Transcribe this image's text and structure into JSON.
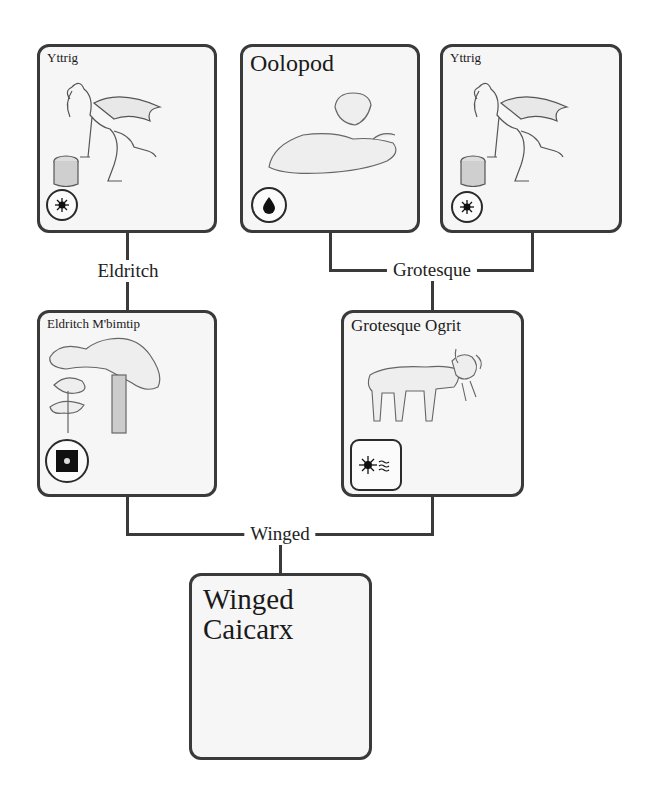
{
  "parents": [
    {
      "name": "Yttrig",
      "badge_icon": "sun-icon",
      "badge_shape": "circle"
    },
    {
      "name": "Oolopod",
      "badge_icon": "water-drop-icon",
      "badge_shape": "circle"
    },
    {
      "name": "Yttrig",
      "badge_icon": "sun-icon",
      "badge_shape": "circle"
    }
  ],
  "connectors": {
    "first": "Eldritch",
    "second": "Grotesque",
    "third": "Winged"
  },
  "middle": [
    {
      "name": "Eldritch M'bimtip",
      "badge_icon": "dark-square-icon",
      "badge_shape": "circle"
    },
    {
      "name": "Grotesque Ogrit",
      "badge_icon": "sun-waves-icon",
      "badge_shape": "rounded"
    }
  ],
  "result": {
    "name_line1": "Winged",
    "name_line2": "Caicarx"
  },
  "colors": {
    "border": "#3a3a3a",
    "card_bg": "#f6f6f6",
    "line": "#3a3a3a"
  }
}
